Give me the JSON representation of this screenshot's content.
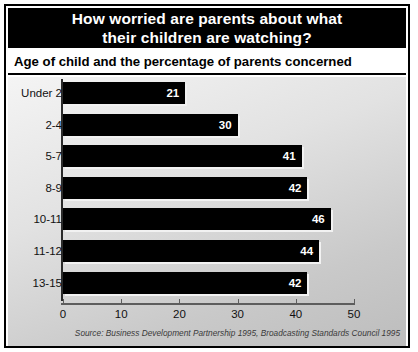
{
  "chart_data": {
    "type": "bar",
    "orientation": "horizontal",
    "title": "How worried are parents about what their children are watching?",
    "title_lines": [
      "How worried are parents about what",
      "their children are watching?"
    ],
    "subtitle": "Age of child and the percentage of parents concerned",
    "categories": [
      "Under 2",
      "2-4",
      "5-7",
      "8-9",
      "10-11",
      "11-12",
      "13-15"
    ],
    "values": [
      21,
      30,
      41,
      42,
      46,
      44,
      42
    ],
    "xlabel": "",
    "ylabel": "",
    "xlim": [
      0,
      50
    ],
    "xticks": [
      0,
      10,
      20,
      30,
      40,
      50
    ],
    "xtick_labels": [
      "0",
      "10",
      "20",
      "30",
      "40",
      "50"
    ],
    "grid": false,
    "legend": false,
    "source": "Source: Business Development Partnership 1995, Broadcasting Standards Council 1995",
    "colors": {
      "bar": "#000000",
      "banner_background": "#000000",
      "banner_text": "#ffffff",
      "value_text": "#ffffff",
      "plot_background": "#dedede",
      "frame_border": "#000000"
    }
  }
}
